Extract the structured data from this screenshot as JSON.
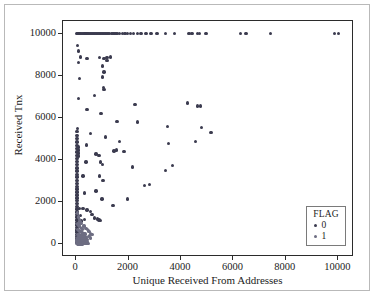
{
  "chart_data": {
    "type": "scatter",
    "title": "",
    "xlabel": "Unique Received From Addresses",
    "ylabel": "Received Tnx",
    "xlim": [
      -500,
      10600
    ],
    "ylim": [
      -600,
      10600
    ],
    "xticks": [
      0,
      2000,
      4000,
      6000,
      8000,
      10000
    ],
    "yticks": [
      0,
      2000,
      4000,
      6000,
      8000,
      10000
    ],
    "xtick_labels": [
      "0",
      "2000",
      "4000",
      "6000",
      "8000",
      "10000"
    ],
    "ytick_labels": [
      "0",
      "2000",
      "4000",
      "6000",
      "8000",
      "10000"
    ],
    "grid": false,
    "legend": {
      "title": "FLAG",
      "position": "lower-right",
      "entries": [
        {
          "label": "0",
          "color": "#3b3b4f"
        },
        {
          "label": "1",
          "color": "#6d6d82"
        }
      ]
    },
    "series": [
      {
        "name": "0",
        "color": "#3b3b4f",
        "points": [
          [
            40,
            10000
          ],
          [
            70,
            10000
          ],
          [
            110,
            10000
          ],
          [
            150,
            10000
          ],
          [
            200,
            10000
          ],
          [
            250,
            10000
          ],
          [
            300,
            10000
          ],
          [
            340,
            10000
          ],
          [
            380,
            10000
          ],
          [
            420,
            10000
          ],
          [
            460,
            10000
          ],
          [
            500,
            10000
          ],
          [
            540,
            10000
          ],
          [
            580,
            10000
          ],
          [
            620,
            10000
          ],
          [
            660,
            10000
          ],
          [
            700,
            10000
          ],
          [
            760,
            10000
          ],
          [
            820,
            10000
          ],
          [
            880,
            10000
          ],
          [
            930,
            10000
          ],
          [
            980,
            10000
          ],
          [
            1040,
            10000
          ],
          [
            1100,
            10000
          ],
          [
            1180,
            10000
          ],
          [
            1260,
            10000
          ],
          [
            1340,
            10000
          ],
          [
            1400,
            10000
          ],
          [
            1460,
            10000
          ],
          [
            1520,
            10000
          ],
          [
            1580,
            10000
          ],
          [
            1650,
            10000
          ],
          [
            1760,
            10000
          ],
          [
            1860,
            10000
          ],
          [
            1960,
            10000
          ],
          [
            2080,
            10000
          ],
          [
            2200,
            10000
          ],
          [
            2340,
            10000
          ],
          [
            2480,
            10000
          ],
          [
            2660,
            10000
          ],
          [
            2860,
            10000
          ],
          [
            3080,
            10000
          ],
          [
            3400,
            10000
          ],
          [
            3760,
            10000
          ],
          [
            4300,
            10000
          ],
          [
            4420,
            10000
          ],
          [
            4620,
            10000
          ],
          [
            4700,
            10000
          ],
          [
            4960,
            10000
          ],
          [
            6280,
            10000
          ],
          [
            6480,
            10000
          ],
          [
            7420,
            10000
          ],
          [
            9860,
            10000
          ],
          [
            10000,
            10000
          ],
          [
            60,
            9430
          ],
          [
            90,
            9180
          ],
          [
            160,
            8900
          ],
          [
            80,
            8630
          ],
          [
            420,
            8820
          ],
          [
            900,
            8880
          ],
          [
            1060,
            8820
          ],
          [
            1180,
            8880
          ],
          [
            1300,
            8900
          ],
          [
            1180,
            8740
          ],
          [
            140,
            7880
          ],
          [
            1010,
            8470
          ],
          [
            1060,
            8180
          ],
          [
            1000,
            7950
          ],
          [
            1040,
            7440
          ],
          [
            1060,
            7340
          ],
          [
            700,
            7060
          ],
          [
            80,
            6920
          ],
          [
            2240,
            6640
          ],
          [
            4260,
            6700
          ],
          [
            4640,
            6560
          ],
          [
            4740,
            6560
          ],
          [
            420,
            6400
          ],
          [
            950,
            6200
          ],
          [
            1560,
            5840
          ],
          [
            2330,
            5810
          ],
          [
            3480,
            5600
          ],
          [
            4780,
            5560
          ],
          [
            5140,
            5320
          ],
          [
            60,
            5490
          ],
          [
            540,
            5260
          ],
          [
            1130,
            5100
          ],
          [
            3520,
            4790
          ],
          [
            4560,
            4880
          ],
          [
            1660,
            4880
          ],
          [
            390,
            4720
          ],
          [
            1450,
            4440
          ],
          [
            1830,
            4400
          ],
          [
            760,
            4280
          ],
          [
            880,
            4230
          ],
          [
            1540,
            4480
          ],
          [
            380,
            3900
          ],
          [
            920,
            3900
          ],
          [
            1010,
            3790
          ],
          [
            3680,
            3740
          ],
          [
            3400,
            3500
          ],
          [
            2140,
            3670
          ],
          [
            260,
            3240
          ],
          [
            900,
            3240
          ],
          [
            1020,
            3030
          ],
          [
            2620,
            2800
          ],
          [
            2800,
            2830
          ],
          [
            320,
            2440
          ],
          [
            760,
            2540
          ],
          [
            980,
            2160
          ],
          [
            1400,
            1830
          ],
          [
            1960,
            2160
          ],
          [
            120,
            1700
          ],
          [
            260,
            1700
          ],
          [
            420,
            1640
          ],
          [
            560,
            1560
          ],
          [
            600,
            1430
          ],
          [
            700,
            1260
          ],
          [
            820,
            1200
          ],
          [
            880,
            1160
          ],
          [
            940,
            1140
          ],
          [
            330,
            1190
          ],
          [
            200,
            1110
          ],
          [
            160,
            1360
          ],
          [
            30,
            5350
          ],
          [
            30,
            5180
          ],
          [
            30,
            5020
          ],
          [
            30,
            4860
          ],
          [
            30,
            4700
          ],
          [
            30,
            4540
          ],
          [
            30,
            4380
          ],
          [
            30,
            4230
          ],
          [
            30,
            4080
          ],
          [
            30,
            3930
          ],
          [
            30,
            3780
          ],
          [
            30,
            3630
          ],
          [
            30,
            3480
          ],
          [
            30,
            3330
          ],
          [
            30,
            3190
          ],
          [
            30,
            3040
          ],
          [
            30,
            2900
          ],
          [
            30,
            2760
          ],
          [
            30,
            2620
          ],
          [
            30,
            2480
          ],
          [
            30,
            2340
          ],
          [
            30,
            2200
          ],
          [
            30,
            2070
          ],
          [
            30,
            1940
          ],
          [
            30,
            1800
          ],
          [
            30,
            1670
          ],
          [
            30,
            1540
          ],
          [
            30,
            1410
          ],
          [
            30,
            1290
          ],
          [
            30,
            1160
          ],
          [
            30,
            1040
          ],
          [
            30,
            920
          ],
          [
            30,
            800
          ],
          [
            30,
            690
          ],
          [
            30,
            580
          ],
          [
            30,
            470
          ],
          [
            30,
            370
          ],
          [
            30,
            270
          ],
          [
            30,
            180
          ],
          [
            30,
            100
          ],
          [
            95,
            4620
          ],
          [
            95,
            4480
          ],
          [
            95,
            4340
          ],
          [
            95,
            4200
          ]
        ]
      },
      {
        "name": "1",
        "color": "#6d6d82",
        "points": [
          [
            55,
            1480
          ],
          [
            90,
            1300
          ],
          [
            120,
            1180
          ],
          [
            150,
            1080
          ],
          [
            185,
            1000
          ],
          [
            70,
            960
          ],
          [
            105,
            900
          ],
          [
            140,
            840
          ],
          [
            175,
            800
          ],
          [
            210,
            760
          ],
          [
            245,
            720
          ],
          [
            60,
            700
          ],
          [
            95,
            660
          ],
          [
            130,
            630
          ],
          [
            165,
            600
          ],
          [
            200,
            580
          ],
          [
            235,
            550
          ],
          [
            270,
            530
          ],
          [
            305,
            510
          ],
          [
            340,
            490
          ],
          [
            50,
            480
          ],
          [
            85,
            460
          ],
          [
            120,
            445
          ],
          [
            155,
            430
          ],
          [
            190,
            415
          ],
          [
            225,
            400
          ],
          [
            260,
            390
          ],
          [
            295,
            375
          ],
          [
            330,
            360
          ],
          [
            365,
            350
          ],
          [
            400,
            340
          ],
          [
            45,
            330
          ],
          [
            80,
            320
          ],
          [
            115,
            310
          ],
          [
            150,
            300
          ],
          [
            185,
            290
          ],
          [
            220,
            280
          ],
          [
            255,
            270
          ],
          [
            290,
            260
          ],
          [
            325,
            250
          ],
          [
            360,
            245
          ],
          [
            395,
            235
          ],
          [
            430,
            225
          ],
          [
            40,
            215
          ],
          [
            75,
            205
          ],
          [
            110,
            198
          ],
          [
            145,
            190
          ],
          [
            180,
            182
          ],
          [
            215,
            175
          ],
          [
            250,
            168
          ],
          [
            285,
            160
          ],
          [
            320,
            152
          ],
          [
            355,
            145
          ],
          [
            390,
            138
          ],
          [
            425,
            130
          ],
          [
            35,
            122
          ],
          [
            70,
            115
          ],
          [
            105,
            108
          ],
          [
            140,
            100
          ],
          [
            175,
            92
          ],
          [
            210,
            85
          ],
          [
            245,
            78
          ],
          [
            280,
            70
          ],
          [
            315,
            62
          ],
          [
            350,
            55
          ],
          [
            385,
            48
          ],
          [
            420,
            42
          ],
          [
            455,
            36
          ],
          [
            30,
            30
          ],
          [
            65,
            25
          ],
          [
            100,
            20
          ],
          [
            135,
            15
          ],
          [
            170,
            10
          ],
          [
            205,
            8
          ],
          [
            240,
            5
          ],
          [
            480,
            640
          ],
          [
            520,
            600
          ],
          [
            300,
            880
          ],
          [
            380,
            760
          ],
          [
            440,
            700
          ],
          [
            560,
            520
          ],
          [
            600,
            470
          ],
          [
            520,
            410
          ],
          [
            470,
            360
          ],
          [
            560,
            300
          ]
        ]
      }
    ]
  }
}
